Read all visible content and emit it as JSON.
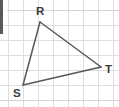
{
  "figure": {
    "type": "geometry-diagram",
    "shape": "triangle",
    "name": "triangle-RST",
    "canvas": {
      "width": 119,
      "height": 107,
      "background": "#ffffff"
    },
    "grid": {
      "visible": true,
      "spacing": 15,
      "origin_x": 8,
      "origin_y": 10,
      "color": "#dcdfdf",
      "border_color": "#d2d5d5",
      "vertical_lines_x": [
        8,
        23,
        38,
        53,
        68,
        83,
        98,
        113
      ],
      "horizontal_lines_y": [
        10,
        25,
        40,
        55,
        70,
        85,
        100
      ]
    },
    "edge_artifact": {
      "visible": true,
      "color": "#5a5a5a",
      "x": 0,
      "y": 0,
      "width": 3,
      "height": 34
    },
    "stroke_color": "#585858",
    "stroke_width": 1.5,
    "label_color": "#3b3b3b",
    "vertices": [
      {
        "id": "R",
        "label": "R",
        "x": 40,
        "y": 22,
        "label_x": 36,
        "label_y": 15
      },
      {
        "id": "S",
        "label": "S",
        "x": 23,
        "y": 85,
        "label_x": 13,
        "label_y": 97
      },
      {
        "id": "T",
        "label": "T",
        "x": 101,
        "y": 67,
        "label_x": 105,
        "label_y": 73
      }
    ],
    "edges": [
      {
        "id": "RS",
        "from": "R",
        "to": "S",
        "x1": 40,
        "y1": 22,
        "x2": 23,
        "y2": 85
      },
      {
        "id": "RT",
        "from": "R",
        "to": "T",
        "x1": 40,
        "y1": 22,
        "x2": 101,
        "y2": 67
      },
      {
        "id": "ST",
        "from": "S",
        "to": "T",
        "x1": 23,
        "y1": 85,
        "x2": 101,
        "y2": 67
      }
    ]
  }
}
